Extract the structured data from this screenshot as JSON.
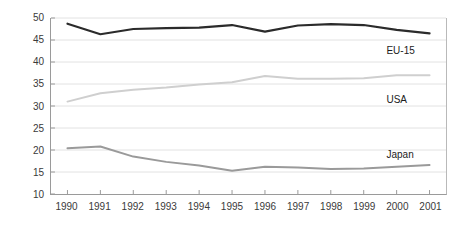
{
  "chart_data": {
    "type": "line",
    "title": "",
    "xlabel": "",
    "ylabel": "",
    "x": [
      1990,
      1991,
      1992,
      1993,
      1994,
      1995,
      1996,
      1997,
      1998,
      1999,
      2000,
      2001
    ],
    "categories": [
      "1990",
      "1991",
      "1992",
      "1993",
      "1994",
      "1995",
      "1996",
      "1997",
      "1998",
      "1999",
      "2000",
      "2001"
    ],
    "ylim": [
      10,
      50
    ],
    "xlim": [
      1990,
      2001
    ],
    "yticks": [
      10,
      15,
      20,
      25,
      30,
      35,
      40,
      45,
      50
    ],
    "ytick_labels": [
      "10",
      "15",
      "20",
      "25",
      "30",
      "35",
      "40",
      "45",
      "50"
    ],
    "grid": true,
    "grid_axis": "y",
    "grid_color": "#e2e2e2",
    "legend_position": "inline-right",
    "series": [
      {
        "name": "EU-15",
        "color": "#2b2b2b",
        "width": 2.2,
        "label_x": 2001,
        "label_y": 42.5,
        "values": [
          48.7,
          46.3,
          47.5,
          47.7,
          47.8,
          48.4,
          46.9,
          48.3,
          48.6,
          48.4,
          47.3,
          46.5
        ]
      },
      {
        "name": "USA",
        "color": "#cfcfcf",
        "width": 2.0,
        "label_x": 2001,
        "label_y": 31.5,
        "values": [
          31.0,
          32.9,
          33.7,
          34.2,
          34.9,
          35.4,
          36.8,
          36.2,
          36.2,
          36.3,
          37.0,
          37.0
        ]
      },
      {
        "name": "Japan",
        "color": "#9a9a9a",
        "width": 2.0,
        "label_x": 2001,
        "label_y": 19.0,
        "values": [
          20.4,
          20.8,
          18.5,
          17.3,
          16.5,
          15.3,
          16.2,
          16.0,
          15.7,
          15.8,
          16.2,
          16.6
        ]
      }
    ]
  },
  "axes": {
    "frame_color": "#9a9a9a",
    "tick_color": "#9a9a9a",
    "label_color": "#3a3a3a"
  }
}
